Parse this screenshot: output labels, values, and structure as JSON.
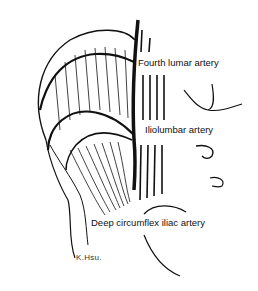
{
  "figure": {
    "labels": [
      {
        "id": "fourth-lumbar",
        "text": "Fourth lumar artery"
      },
      {
        "id": "iliolumbar",
        "text": "Iliolumbar artery"
      },
      {
        "id": "deep-circumflex-iliac",
        "text": "Deep circumflex iliac artery"
      }
    ],
    "signature": "K.Hsu.",
    "colors": {
      "ink": "#111111",
      "background": "#ffffff"
    }
  }
}
